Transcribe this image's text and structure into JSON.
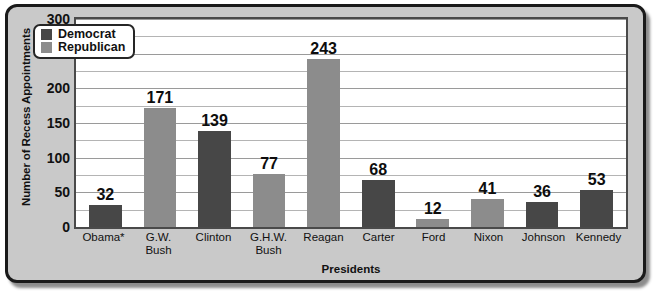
{
  "chart_data": {
    "type": "bar",
    "title": "",
    "xlabel": "Presidents",
    "ylabel": "Number of Recess Appointments",
    "ylim": [
      0,
      300
    ],
    "ytick_step": 50,
    "gridline_step": 25,
    "grid": true,
    "legend_position": "top-left",
    "categories": [
      "Obama*",
      "G.W. Bush",
      "Clinton",
      "G.H.W. Bush",
      "Reagan",
      "Carter",
      "Ford",
      "Nixon",
      "Johnson",
      "Kennedy"
    ],
    "category_lines": [
      [
        "Obama*"
      ],
      [
        "G.W.",
        "Bush"
      ],
      [
        "Clinton"
      ],
      [
        "G.H.W.",
        "Bush"
      ],
      [
        "Reagan"
      ],
      [
        "Carter"
      ],
      [
        "Ford"
      ],
      [
        "Nixon"
      ],
      [
        "Johnson"
      ],
      [
        "Kennedy"
      ]
    ],
    "values": [
      32,
      171,
      139,
      77,
      243,
      68,
      12,
      41,
      36,
      53
    ],
    "party": [
      "Democrat",
      "Republican",
      "Democrat",
      "Republican",
      "Republican",
      "Democrat",
      "Republican",
      "Republican",
      "Democrat",
      "Democrat"
    ],
    "ytick_labels": [
      "300",
      "250",
      "200",
      "150",
      "100",
      "50",
      "0"
    ],
    "ytick_values": [
      300,
      250,
      200,
      150,
      100,
      50,
      0
    ],
    "legend": [
      {
        "label": "Democrat",
        "color": "#474747"
      },
      {
        "label": "Republican",
        "color": "#8c8c8c"
      }
    ],
    "colors": {
      "democrat": "#474747",
      "republican": "#8c8c8c",
      "plot_background": "#ffffff",
      "frame_background": "#c9c9c9",
      "gridline": "#b4b4b4",
      "text": "#111111"
    }
  }
}
